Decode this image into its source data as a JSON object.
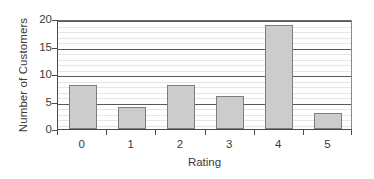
{
  "chart_data": {
    "type": "bar",
    "title": "",
    "xlabel": "Rating",
    "ylabel": "Number of Customers",
    "categories": [
      "0",
      "1",
      "2",
      "3",
      "4",
      "5"
    ],
    "values": [
      8,
      4,
      8,
      6,
      19,
      3
    ],
    "ylim": [
      0,
      20
    ],
    "y_major_ticks": [
      0,
      5,
      10,
      15,
      20
    ],
    "y_tick_labels": [
      "0",
      "5",
      "10",
      "15",
      "20"
    ],
    "y_minor_step": 1,
    "grid": true,
    "grid_orientation": "horizontal",
    "legend": false,
    "legend_position": "none",
    "bar_fill_color": "#cccccc",
    "bar_edge_color": "#7d7d7d",
    "major_gridline_color": "#5a5a5a",
    "minor_gridline_color": "#e6e6e6",
    "axis_color": "#4a4a4a",
    "background_color": "#ffffff",
    "text_color": "#3a3a3a"
  }
}
